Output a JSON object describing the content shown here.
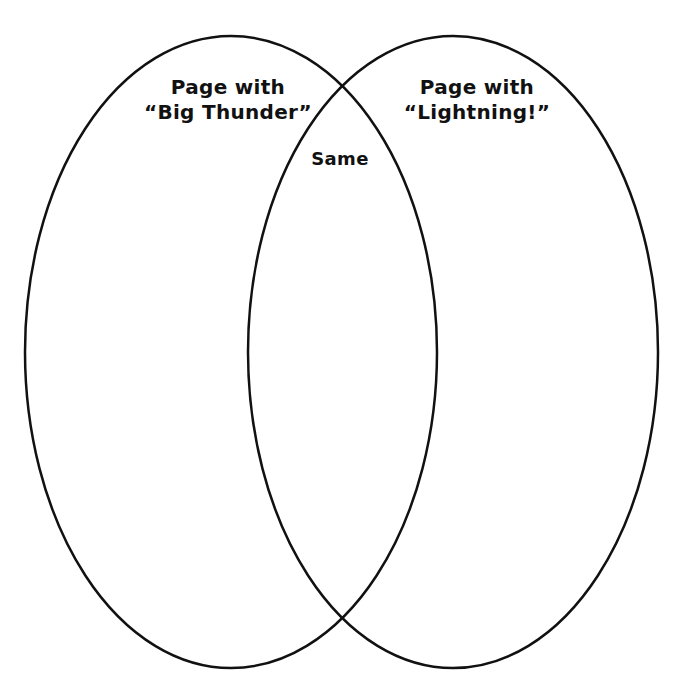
{
  "diagram": {
    "type": "venn",
    "stroke_color": "#111111",
    "background_color": "#ffffff",
    "sets": [
      {
        "id": "left",
        "title_line1": "Page with",
        "title_line2": "“Big Thunder”"
      },
      {
        "id": "right",
        "title_line1": "Page with",
        "title_line2": "“Lightning!”"
      }
    ],
    "intersection": {
      "label": "Same"
    }
  }
}
